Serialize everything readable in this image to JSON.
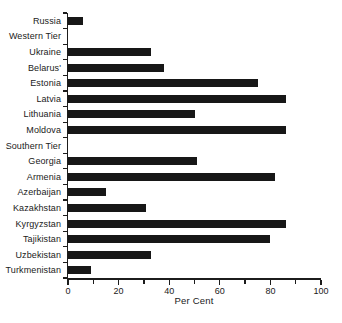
{
  "figure": {
    "background": "#ffffff",
    "bar_color": "#171717",
    "axis_color": "#1c1c1c",
    "text_color": "#1a1a1a"
  },
  "chart_data": {
    "type": "bar",
    "orientation": "horizontal",
    "title": "",
    "xlabel": "Per Cent",
    "ylabel": "",
    "xlim": [
      0,
      100
    ],
    "x_major_ticks": [
      0,
      20,
      40,
      60,
      80,
      100
    ],
    "x_minor_ticks": [
      10,
      30,
      50,
      70,
      90
    ],
    "grid": false,
    "legend": false,
    "categories": [
      "Russia",
      "Western Tier",
      "Ukraine",
      "Belarus'",
      "Estonia",
      "Latvia",
      "Lithuania",
      "Moldova",
      "Southern Tier",
      "Georgia",
      "Armenia",
      "Azerbaijan",
      "Kazakhstan",
      "Kyrgyzstan",
      "Tajikistan",
      "Uzbekistan",
      "Turkmenistan"
    ],
    "values": [
      6,
      null,
      33,
      38,
      75,
      86,
      50,
      86,
      null,
      51,
      82,
      15,
      31,
      86,
      80,
      33,
      9
    ]
  }
}
